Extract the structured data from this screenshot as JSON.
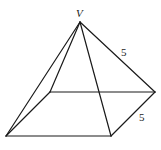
{
  "figure": {
    "vertices": {
      "V": [
        80,
        22
      ],
      "A_front_left": [
        6,
        136
      ],
      "B_front_right": [
        111,
        136
      ],
      "C_back_right": [
        155,
        92
      ],
      "D_back_left": [
        50,
        92
      ]
    },
    "labels": {
      "apex": "V",
      "lateral_edge": "5",
      "base_edge": "5"
    },
    "colors": {
      "line": "#1a1a1a",
      "background": "#ffffff"
    }
  }
}
